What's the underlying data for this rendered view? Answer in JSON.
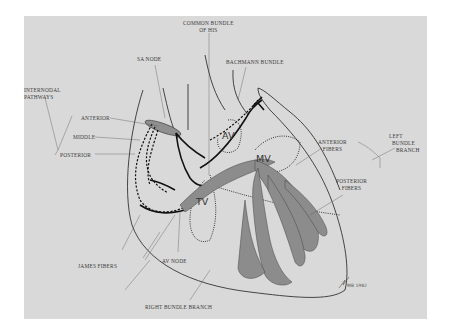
{
  "figure": {
    "background_color": "#d9d9d9",
    "line_color": "#1e1e1e",
    "fiber_color": "#8a8a8a"
  },
  "labels": {
    "common_bundle": [
      "COMMON BUNDLE",
      "OF HIS"
    ],
    "sa_node": "SA NODE",
    "bachmann_bundle": "BACHMANN BUNDLE",
    "internodal_pathways": [
      "INTERNODAL",
      "PATHWAYS"
    ],
    "anterior": "ANTERIOR",
    "middle": "MIDDLE",
    "posterior": "POSTERIOR",
    "anterior_fibers": [
      "ANTERIOR",
      "FIBERS"
    ],
    "posterior_fibers": [
      "POSTERIOR",
      "FIBERS"
    ],
    "left_bundle_branch": [
      "LEFT",
      "BUNDLE",
      "BRANCH"
    ],
    "james_fibers": "JAMES FIBERS",
    "av_node": "AV NODE",
    "right_bundle_branch": "RIGHT BUNDLE BRANCH"
  },
  "chambers": {
    "av": "AV",
    "mv": "MV",
    "tv": "TV"
  },
  "signature": "MB 1982"
}
